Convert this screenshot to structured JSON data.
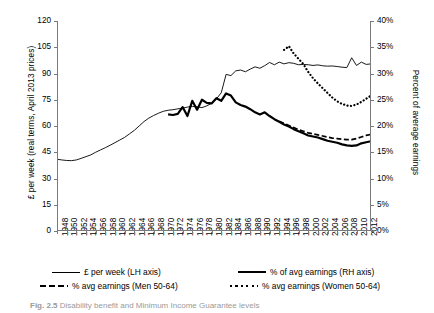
{
  "chart_data": {
    "type": "line",
    "title": "",
    "xlabel": "",
    "ylabel": "£ per week (real terms, April 2013 prices)",
    "y2label": "Percent of average earnings",
    "xlim": [
      1948,
      2013
    ],
    "ylim": [
      0,
      120
    ],
    "y2lim": [
      0,
      0.4
    ],
    "grid": false,
    "legend_position": "bottom",
    "xticks": [
      "1948",
      "1950",
      "1952",
      "1954",
      "1956",
      "1958",
      "1960",
      "1962",
      "1964",
      "1966",
      "1968",
      "1970",
      "1972",
      "1974",
      "1976",
      "1978",
      "1980",
      "1982",
      "1984",
      "1986",
      "1988",
      "1990",
      "1992",
      "1994",
      "1996",
      "1998",
      "2000",
      "2002",
      "2004",
      "2006",
      "2008",
      "2010",
      "2012"
    ],
    "yticks": [
      "0",
      "15",
      "30",
      "45",
      "60",
      "75",
      "90",
      "105",
      "120"
    ],
    "y2ticks": [
      "0%",
      "5%",
      "10%",
      "15%",
      "20%",
      "25%",
      "30%",
      "35%",
      "40%"
    ],
    "series": [
      {
        "name": "£ per week (LH axis)",
        "style": "thin-solid",
        "axis": "left",
        "x": [
          1948,
          1949,
          1950,
          1951,
          1952,
          1953,
          1954,
          1955,
          1956,
          1957,
          1958,
          1959,
          1960,
          1961,
          1962,
          1963,
          1964,
          1965,
          1966,
          1967,
          1968,
          1969,
          1970,
          1971,
          1972,
          1973,
          1974,
          1975,
          1976,
          1977,
          1978,
          1979,
          1980,
          1981,
          1982,
          1983,
          1984,
          1985,
          1986,
          1987,
          1988,
          1989,
          1990,
          1991,
          1992,
          1993,
          1994,
          1995,
          1996,
          1997,
          1998,
          1999,
          2000,
          2001,
          2002,
          2003,
          2004,
          2005,
          2006,
          2007,
          2008,
          2009,
          2010,
          2011,
          2012,
          2013
        ],
        "values": [
          41,
          40.6,
          40.3,
          40.2,
          40.6,
          41.5,
          42.5,
          43.5,
          45,
          46.3,
          47.6,
          49,
          50.5,
          52,
          53.5,
          55.5,
          57.5,
          60,
          62.5,
          64.5,
          66,
          67.3,
          68.4,
          69,
          69.3,
          69.8,
          70.2,
          70.8,
          71.2,
          71,
          70.5,
          71.5,
          73,
          75.5,
          79,
          89.5,
          88.8,
          91.5,
          92,
          91,
          92.5,
          93.8,
          93,
          94.5,
          96.3,
          95,
          96.5,
          95.5,
          96.2,
          95.8,
          95,
          95.2,
          95,
          94.6,
          94.9,
          94.4,
          94.2,
          94.3,
          94,
          93.6,
          93.4,
          99,
          94.6,
          96.5,
          95.2,
          95.5
        ]
      },
      {
        "name": "% of avg earnings (RH axis)",
        "style": "thick-solid",
        "axis": "right",
        "x": [
          1971,
          1972,
          1973,
          1974,
          1975,
          1976,
          1977,
          1978,
          1979,
          1980,
          1981,
          1982,
          1983,
          1984,
          1985,
          1986,
          1987,
          1988,
          1989,
          1990,
          1991,
          1992,
          1993,
          1994,
          1995,
          1996,
          1997,
          1998,
          1999,
          2000,
          2001,
          2002,
          2003,
          2004,
          2005,
          2006,
          2007,
          2008,
          2009,
          2010,
          2011,
          2012,
          2013
        ],
        "values": [
          0.222,
          0.221,
          0.223,
          0.236,
          0.219,
          0.248,
          0.231,
          0.25,
          0.244,
          0.243,
          0.253,
          0.248,
          0.262,
          0.258,
          0.245,
          0.24,
          0.237,
          0.232,
          0.226,
          0.222,
          0.226,
          0.219,
          0.213,
          0.208,
          0.203,
          0.199,
          0.194,
          0.19,
          0.186,
          0.182,
          0.18,
          0.178,
          0.175,
          0.172,
          0.17,
          0.168,
          0.165,
          0.163,
          0.162,
          0.163,
          0.167,
          0.169,
          0.171
        ]
      },
      {
        "name": "% avg earnings (Men 50-64)",
        "style": "dashed",
        "axis": "right",
        "x": [
          1994,
          1995,
          1996,
          1997,
          1998,
          1999,
          2000,
          2001,
          2002,
          2003,
          2004,
          2005,
          2006,
          2007,
          2008,
          2009,
          2010,
          2011,
          2012,
          2013
        ],
        "values": [
          0.209,
          0.205,
          0.201,
          0.197,
          0.193,
          0.19,
          0.187,
          0.185,
          0.183,
          0.181,
          0.179,
          0.177,
          0.176,
          0.175,
          0.174,
          0.174,
          0.176,
          0.179,
          0.182,
          0.184
        ]
      },
      {
        "name": "% avg earnings (Women 50-64)",
        "style": "dotted",
        "axis": "right",
        "x": [
          1995,
          1996,
          1997,
          1998,
          1999,
          2000,
          2001,
          2002,
          2003,
          2004,
          2005,
          2006,
          2007,
          2008,
          2009,
          2010,
          2011,
          2012,
          2013
        ],
        "values": [
          0.345,
          0.352,
          0.338,
          0.328,
          0.318,
          0.303,
          0.291,
          0.281,
          0.272,
          0.263,
          0.254,
          0.247,
          0.242,
          0.239,
          0.238,
          0.241,
          0.246,
          0.252,
          0.258
        ]
      }
    ]
  },
  "legend": [
    {
      "label": "£ per week (LH axis)",
      "style": "thin-solid"
    },
    {
      "label": "% of avg earnings (RH axis)",
      "style": "thick-solid"
    },
    {
      "label": "% avg earnings (Men 50-64)",
      "style": "dashed"
    },
    {
      "label": "% avg earnings (Women 50-64)",
      "style": "dotted"
    }
  ],
  "caption": {
    "number": "Fig. 2.5",
    "text": "Disability benefit and Minimum Income Guarantee levels"
  }
}
